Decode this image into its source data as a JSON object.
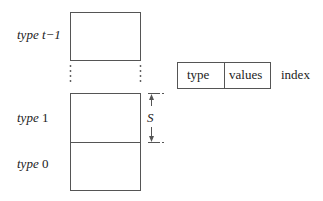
{
  "diagram": {
    "stack_labels": [
      {
        "word": "type",
        "suffix": "t−1"
      },
      {
        "word": "type",
        "suffix": "1"
      },
      {
        "word": "type",
        "suffix": "0"
      }
    ],
    "size_label": "S",
    "record": {
      "fields": [
        "type",
        "values"
      ],
      "trailing_label": "index"
    },
    "colors": {
      "line": "#555555",
      "text": "#222222"
    }
  }
}
